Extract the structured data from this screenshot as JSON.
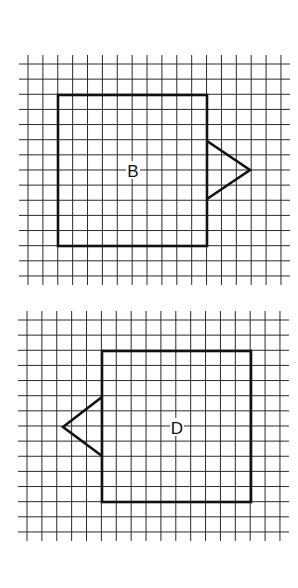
{
  "figures": [
    {
      "label": "B",
      "grid": {
        "x0": 28,
        "y0": 64,
        "cols": 17,
        "rows": 14,
        "spacing_x": 14.88,
        "spacing_y": 15.14,
        "tick_extend": 9
      },
      "rectangle": {
        "x": 58,
        "y": 95,
        "width": 149,
        "height": 151
      },
      "triangle": {
        "side": "right",
        "points": [
          [
            207,
            141
          ],
          [
            250,
            170
          ],
          [
            207,
            199
          ]
        ]
      },
      "label_position": [
        133,
        170
      ]
    },
    {
      "label": "D",
      "grid": {
        "x0": 27,
        "y0": 320,
        "cols": 17,
        "rows": 14,
        "spacing_x": 14.88,
        "spacing_y": 15.14,
        "tick_extend": 9
      },
      "rectangle": {
        "x": 102,
        "y": 351,
        "width": 149,
        "height": 151
      },
      "triangle": {
        "side": "left",
        "points": [
          [
            102,
            397
          ],
          [
            63,
            427
          ],
          [
            102,
            456
          ]
        ]
      },
      "label_position": [
        177,
        427
      ]
    }
  ],
  "colors": {
    "line": "#111111",
    "grid": "#2a2a2a",
    "background": "#ffffff"
  }
}
